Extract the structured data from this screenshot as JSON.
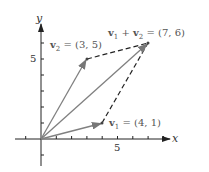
{
  "diagram": {
    "axes": {
      "x_label": "x",
      "y_label": "y",
      "x_tick_label": "5",
      "y_tick_label": "5",
      "x_ticks": [
        -1,
        1,
        2,
        3,
        4,
        5,
        6,
        7,
        8
      ],
      "y_ticks": [
        -1,
        1,
        2,
        3,
        4,
        5,
        6
      ]
    },
    "vectors": [
      {
        "name": "v1",
        "label_bold": "v",
        "label_sub": "1",
        "label_rest": " = (4, 1)",
        "x": 4,
        "y": 1,
        "style": "solid"
      },
      {
        "name": "v2",
        "label_bold": "v",
        "label_sub": "2",
        "label_rest": " = (3, 5)",
        "x": 3,
        "y": 5,
        "style": "solid"
      },
      {
        "name": "v1+v2",
        "label_a_bold": "v",
        "label_a_sub": "1",
        "label_mid": " + ",
        "label_b_bold": "v",
        "label_b_sub": "2",
        "label_rest": " = (7, 6)",
        "x": 7,
        "y": 6,
        "style": "solid"
      }
    ],
    "dashed_edges": [
      {
        "from": [
          3,
          5
        ],
        "to": [
          7,
          6
        ]
      },
      {
        "from": [
          4,
          1
        ],
        "to": [
          7,
          6
        ]
      }
    ],
    "colors": {
      "vector": "#808080",
      "axis": "#222222",
      "dashed": "#222222"
    }
  }
}
